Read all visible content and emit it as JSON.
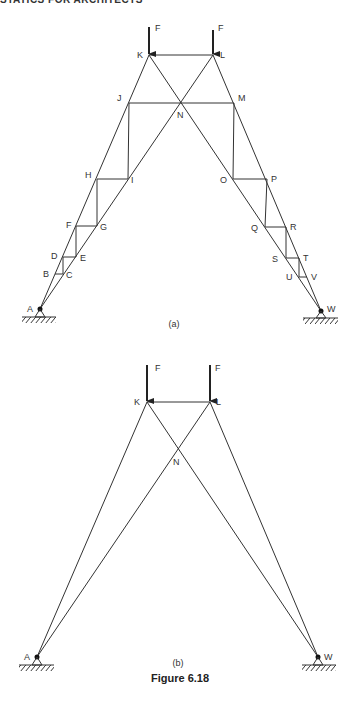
{
  "header": {
    "running_title": "STATICS FOR ARCHITECTS"
  },
  "figure": {
    "title": "Figure 6.18",
    "parts": [
      {
        "caption": "(a)",
        "load_label": "F",
        "nodes": {
          "A": [
            40,
            309
          ],
          "B": [
            55,
            274
          ],
          "C": [
            63,
            274
          ],
          "D": [
            63,
            257
          ],
          "E": [
            76,
            257
          ],
          "F": [
            76,
            226
          ],
          "G": [
            97,
            226
          ],
          "H": [
            97,
            179
          ],
          "I": [
            128,
            179
          ],
          "J": [
            129,
            103
          ],
          "K": [
            149,
            55
          ],
          "L": [
            213,
            55
          ],
          "M": [
            234,
            103
          ],
          "N": [
            181,
            103
          ],
          "O": [
            233,
            179
          ],
          "P": [
            267,
            179
          ],
          "Q": [
            265,
            227
          ],
          "R": [
            286,
            227
          ],
          "S": [
            286,
            258
          ],
          "T": [
            299,
            258
          ],
          "U": [
            299,
            277
          ],
          "V": [
            307,
            277
          ],
          "W": [
            321,
            311
          ]
        },
        "node_labels": [
          "A",
          "B",
          "C",
          "D",
          "E",
          "F",
          "G",
          "H",
          "I",
          "J",
          "K",
          "L",
          "M",
          "N",
          "O",
          "P",
          "Q",
          "R",
          "S",
          "T",
          "U",
          "V",
          "W"
        ]
      },
      {
        "caption": "(b)",
        "load_label": "F",
        "nodes": {
          "A": [
            37,
            657
          ],
          "K": [
            147,
            402
          ],
          "L": [
            210,
            402
          ],
          "N": [
            177,
            449
          ],
          "W": [
            318,
            657
          ]
        },
        "node_labels": [
          "A",
          "K",
          "L",
          "N",
          "W"
        ]
      }
    ]
  }
}
